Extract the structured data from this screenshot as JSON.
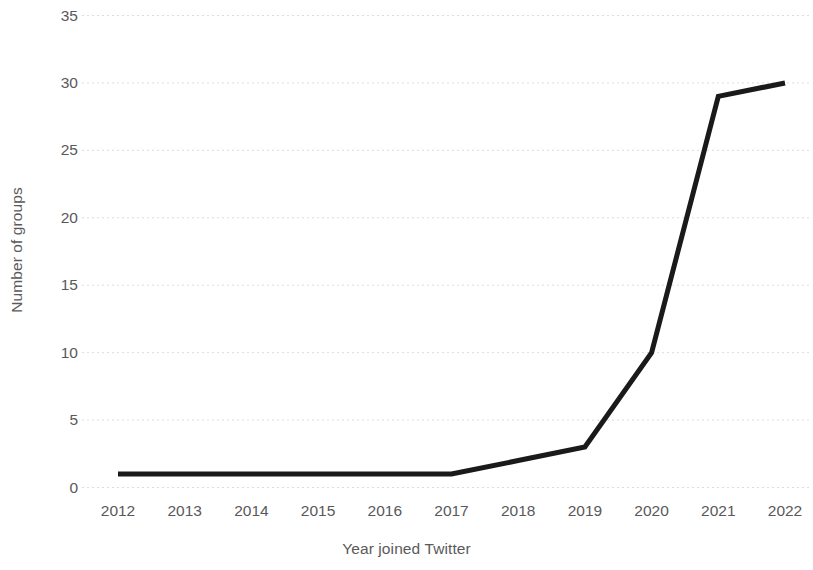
{
  "chart_data": {
    "type": "line",
    "title": "",
    "xlabel": "Year joined Twitter",
    "ylabel": "Number of groups",
    "categories": [
      "2012",
      "2013",
      "2014",
      "2015",
      "2016",
      "2017",
      "2018",
      "2019",
      "2020",
      "2021",
      "2022"
    ],
    "values": [
      1,
      1,
      1,
      1,
      1,
      1,
      2,
      3,
      10,
      29,
      30
    ],
    "series": [
      {
        "name": "Number of groups",
        "values": [
          1,
          1,
          1,
          1,
          1,
          1,
          2,
          3,
          10,
          29,
          30
        ],
        "color": "#1a1a1a",
        "line_width": 5
      }
    ],
    "ylim": [
      0,
      35
    ],
    "ytick_labels": [
      "0",
      "5",
      "10",
      "15",
      "20",
      "25",
      "30",
      "35"
    ],
    "ytick_values": [
      0,
      5,
      10,
      15,
      20,
      25,
      30,
      35
    ],
    "grid": {
      "horizontal": true,
      "vertical": false,
      "style": "dotted",
      "color": "#dcdcdc"
    },
    "legend": {
      "visible": false,
      "position": "none"
    },
    "markers": false,
    "background_color": "#ffffff",
    "tick_label_color": "#59595b",
    "axis_title_color": "#5a5a5a"
  }
}
